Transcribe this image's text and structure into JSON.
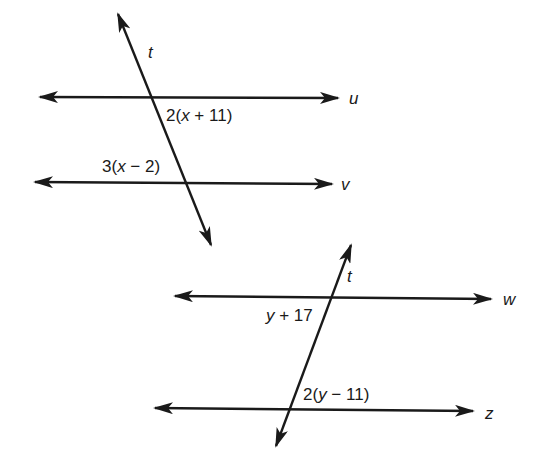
{
  "figure_top": {
    "transversal": {
      "label": "t"
    },
    "line1": {
      "label": "u"
    },
    "line2": {
      "label": "v"
    },
    "angle1": {
      "coef": "2(",
      "var": "x",
      "rest": " + 11)"
    },
    "angle2": {
      "coef": "3(",
      "var": "x",
      "rest": " − 2)"
    }
  },
  "figure_bottom": {
    "transversal": {
      "label": "t"
    },
    "line1": {
      "label": "w"
    },
    "line2": {
      "label": "z"
    },
    "angle1": {
      "coef": "",
      "var": "y",
      "rest": " + 17"
    },
    "angle2": {
      "coef": "2(",
      "var": "y",
      "rest": " − 11)"
    }
  },
  "colors": {
    "ink": "#1a1a1a",
    "background": "#ffffff"
  }
}
